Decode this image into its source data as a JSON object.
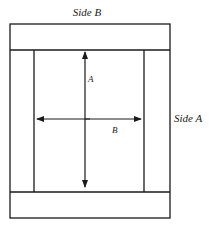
{
  "diagram": {
    "labels": {
      "side_b": "Side B",
      "side_a": "Side A",
      "arrow_a": "A",
      "arrow_b": "B"
    },
    "colors": {
      "stroke": "#1a1a1a",
      "background": "#ffffff"
    }
  }
}
